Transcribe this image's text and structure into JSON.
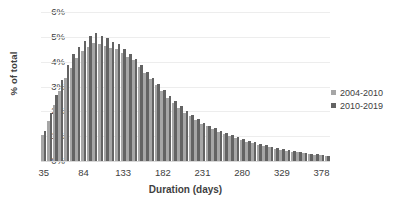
{
  "chart_data": {
    "type": "bar",
    "title": "",
    "subtitle": "",
    "xlabel": "Duration (days)",
    "ylabel": "% of total",
    "ylim": [
      0,
      6
    ],
    "ytick_labels": [
      "6%",
      "5%",
      "4%",
      "3%",
      "2%",
      "1%",
      "0%"
    ],
    "ytick_values": [
      6,
      5,
      4,
      3,
      2,
      1,
      0
    ],
    "grid": true,
    "legend_position": "right",
    "xtick_labels": [
      "35",
      "84",
      "133",
      "182",
      "231",
      "280",
      "329",
      "378"
    ],
    "xtick_values": [
      35,
      84,
      133,
      182,
      231,
      280,
      329,
      378
    ],
    "x_step_days": 7,
    "x_start_day": 35,
    "categories": [
      "35",
      "42",
      "49",
      "56",
      "63",
      "70",
      "77",
      "84",
      "91",
      "98",
      "105",
      "112",
      "119",
      "126",
      "133",
      "140",
      "147",
      "154",
      "161",
      "168",
      "175",
      "182",
      "189",
      "196",
      "203",
      "210",
      "217",
      "224",
      "231",
      "238",
      "245",
      "252",
      "259",
      "266",
      "273",
      "280",
      "287",
      "294",
      "301",
      "308",
      "315",
      "322",
      "329",
      "336",
      "343",
      "350",
      "357",
      "364",
      "371",
      "378",
      "385"
    ],
    "series": [
      {
        "name": "2004-2010",
        "color": "#a6a6a6",
        "values": [
          1.05,
          1.6,
          2.25,
          2.8,
          3.35,
          3.75,
          4.15,
          4.45,
          4.6,
          4.75,
          4.7,
          4.65,
          4.55,
          4.5,
          4.35,
          4.2,
          4.05,
          3.8,
          3.55,
          3.3,
          3.05,
          2.8,
          2.55,
          2.35,
          2.15,
          1.95,
          1.8,
          1.65,
          1.5,
          1.4,
          1.28,
          1.18,
          1.08,
          1.0,
          0.92,
          0.85,
          0.78,
          0.72,
          0.66,
          0.6,
          0.55,
          0.5,
          0.46,
          0.42,
          0.38,
          0.35,
          0.32,
          0.29,
          0.26,
          0.24,
          0.21
        ]
      },
      {
        "name": "2010-2019",
        "color": "#636363",
        "values": [
          1.2,
          1.95,
          2.65,
          3.25,
          3.85,
          4.3,
          4.6,
          4.85,
          5.05,
          5.15,
          5.05,
          4.95,
          4.8,
          4.7,
          4.5,
          4.3,
          4.1,
          3.85,
          3.6,
          3.35,
          3.1,
          2.85,
          2.6,
          2.4,
          2.2,
          2.0,
          1.85,
          1.7,
          1.55,
          1.43,
          1.32,
          1.22,
          1.12,
          1.03,
          0.95,
          0.88,
          0.81,
          0.75,
          0.69,
          0.63,
          0.58,
          0.53,
          0.48,
          0.44,
          0.4,
          0.36,
          0.33,
          0.3,
          0.27,
          0.25,
          0.22
        ]
      }
    ]
  }
}
